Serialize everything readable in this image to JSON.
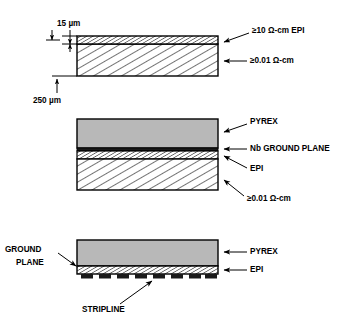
{
  "diagram": {
    "colors": {
      "pyrex_fill": "#b8b8b8",
      "line": "#000000",
      "metal_fill": "#1a1a1a",
      "background": "#ffffff"
    },
    "panels": [
      {
        "id": "top",
        "name": "epi-on-substrate",
        "dimensions": [
          {
            "name": "epi-thickness",
            "text": "15 µm"
          },
          {
            "name": "substrate-thickness",
            "text": "250 µm"
          }
        ],
        "labels": [
          {
            "name": "epi-layer",
            "text": "≥10 Ω-cm EPI"
          },
          {
            "name": "substrate-layer",
            "text": "≥0.01 Ω-cm"
          }
        ]
      },
      {
        "id": "middle",
        "name": "pyrex-bonded-with-ground-plane",
        "labels": [
          {
            "name": "pyrex-layer",
            "text": "PYREX"
          },
          {
            "name": "nb-ground-plane-layer",
            "text": "Nb GROUND PLANE"
          },
          {
            "name": "epi-layer",
            "text": "EPI"
          },
          {
            "name": "substrate-layer",
            "text": "≥0.01 Ω-cm"
          }
        ]
      },
      {
        "id": "bottom",
        "name": "stripline-after-substrate-removal",
        "stripline_segments": 8,
        "labels": [
          {
            "name": "ground-plane-label-line1",
            "text": "GROUND"
          },
          {
            "name": "ground-plane-label-line2",
            "text": "PLANE"
          },
          {
            "name": "pyrex-layer",
            "text": "PYREX"
          },
          {
            "name": "epi-layer",
            "text": "EPI"
          },
          {
            "name": "stripline-layer",
            "text": "STRIPLINE"
          }
        ]
      }
    ]
  }
}
